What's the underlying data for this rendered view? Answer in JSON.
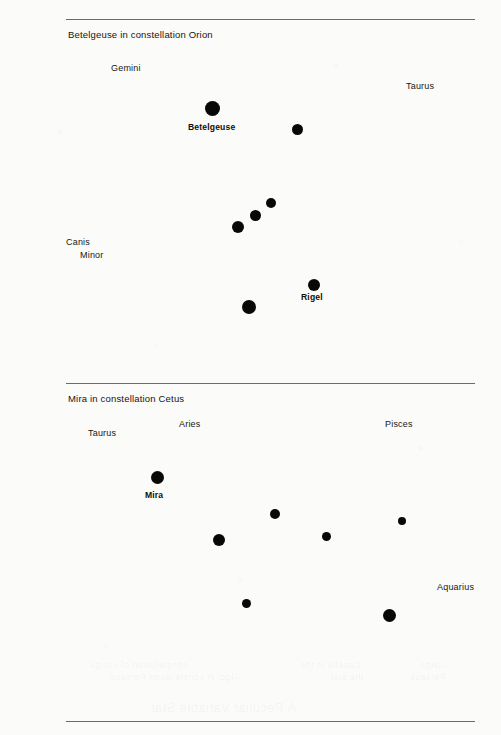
{
  "page": {
    "background_color": "#fbfbf9",
    "ink_color": "#080806",
    "rule_color": "#4a4a4a"
  },
  "rules": [
    {
      "name": "top-rule",
      "x": 66,
      "y": 19,
      "width": 409
    },
    {
      "name": "middle-rule",
      "x": 66,
      "y": 383,
      "width": 409
    },
    {
      "name": "bottom-rule",
      "x": 66,
      "y": 721,
      "width": 409
    }
  ],
  "panels": [
    {
      "id": "orion",
      "title": "Betelgeuse in constellation Orion",
      "title_pos": {
        "x": 68,
        "y": 29
      },
      "constellation_labels": [
        {
          "text": "Gemini",
          "x": 111,
          "y": 63
        },
        {
          "text": "Taurus",
          "x": 406,
          "y": 81
        },
        {
          "text": "Canis",
          "x": 66,
          "y": 237
        },
        {
          "text": "Minor",
          "x": 80,
          "y": 250
        }
      ],
      "stars": [
        {
          "name": "betelgeuse",
          "cx": 212,
          "cy": 108,
          "r": 7.5
        },
        {
          "name": "bellatrix",
          "cx": 297,
          "cy": 129,
          "r": 5.5
        },
        {
          "name": "alnitak",
          "cx": 271,
          "cy": 203,
          "r": 5.0
        },
        {
          "name": "alnilam",
          "cx": 255,
          "cy": 215,
          "r": 5.5
        },
        {
          "name": "mintaka",
          "cx": 238,
          "cy": 227,
          "r": 6.0
        },
        {
          "name": "rigel",
          "cx": 314,
          "cy": 285,
          "r": 6.0
        },
        {
          "name": "saiph",
          "cx": 249,
          "cy": 307,
          "r": 7.0
        }
      ],
      "star_labels": [
        {
          "text": "Betelgeuse",
          "x": 188,
          "y": 122
        },
        {
          "text": "Rigel",
          "x": 301,
          "y": 292
        }
      ]
    },
    {
      "id": "cetus",
      "title": "Mira in constellation Cetus",
      "title_pos": {
        "x": 68,
        "y": 393
      },
      "constellation_labels": [
        {
          "text": "Taurus",
          "x": 88,
          "y": 428
        },
        {
          "text": "Aries",
          "x": 179,
          "y": 419
        },
        {
          "text": "Pisces",
          "x": 385,
          "y": 419
        },
        {
          "text": "Aquarius",
          "x": 437,
          "y": 582
        }
      ],
      "stars": [
        {
          "name": "mira",
          "cx": 157,
          "cy": 477,
          "r": 6.5
        },
        {
          "name": "menkar",
          "cx": 275,
          "cy": 514,
          "r": 5.0
        },
        {
          "name": "kaffaljid",
          "cx": 219,
          "cy": 540,
          "r": 6.0
        },
        {
          "name": "baten",
          "cx": 326,
          "cy": 536,
          "r": 4.5
        },
        {
          "name": "eta-ceti",
          "cx": 402,
          "cy": 521,
          "r": 4.0
        },
        {
          "name": "tau-ceti",
          "cx": 246,
          "cy": 603,
          "r": 4.5
        },
        {
          "name": "deneb-kai",
          "cx": 389,
          "cy": 615,
          "r": 6.5
        }
      ],
      "star_labels": [
        {
          "text": "Mira",
          "x": 145,
          "y": 490
        }
      ]
    }
  ],
  "bleed_through": [
    {
      "text": "constellation of Auriga",
      "x": 90,
      "y": 660
    },
    {
      "text": "Capella in the",
      "x": 300,
      "y": 660
    },
    {
      "text": "Auriga",
      "x": 420,
      "y": 660
    },
    {
      "text": "Algol in constellation Perseus",
      "x": 110,
      "y": 672
    },
    {
      "text": "the star",
      "x": 330,
      "y": 672
    },
    {
      "text": "Perseus",
      "x": 410,
      "y": 672
    },
    {
      "text": "A Peculiar Variable Star",
      "x": 150,
      "y": 700
    }
  ]
}
